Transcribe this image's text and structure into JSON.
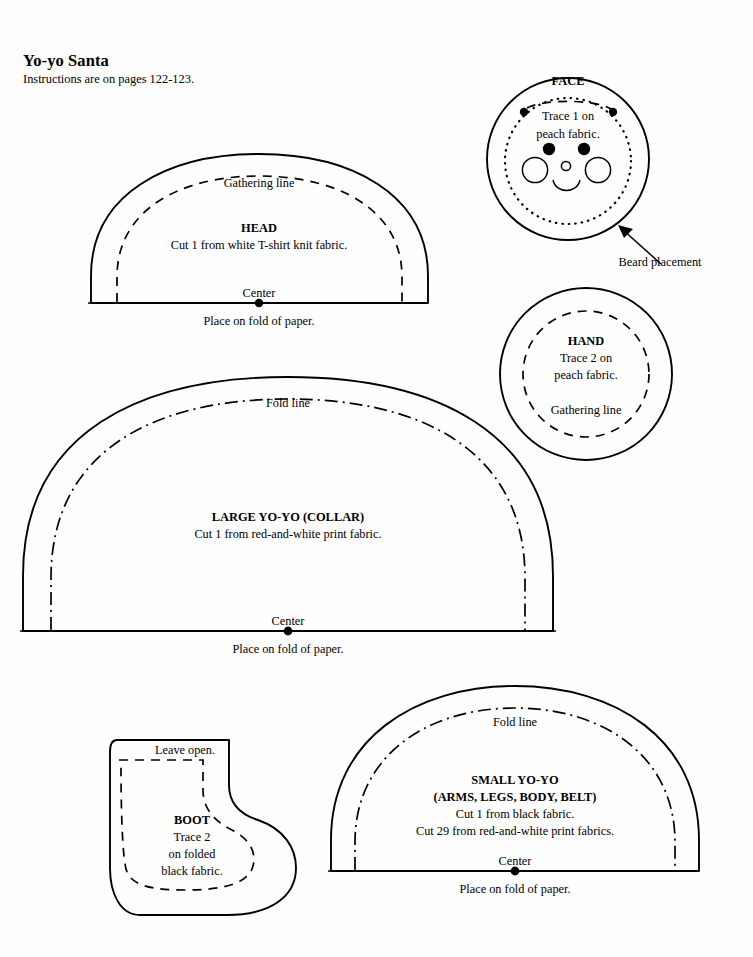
{
  "page": {
    "title": "Yo-yo Santa",
    "subtitle": "Instructions are on pages 122-123.",
    "background_color": "#fefefe",
    "ink_color": "#000000"
  },
  "patterns": {
    "head": {
      "name": "HEAD",
      "instruction": "Cut 1 from white T-shirt knit fabric.",
      "gathering_label": "Gathering line",
      "center_label": "Center",
      "fold_note": "Place on fold of paper."
    },
    "face": {
      "name": "FACE",
      "instruction_line1": "Trace 1 on",
      "instruction_line2": "peach fabric.",
      "beard_label": "Beard placement"
    },
    "hand": {
      "name": "HAND",
      "instruction_line1": "Trace 2 on",
      "instruction_line2": "peach fabric.",
      "gathering_label": "Gathering line"
    },
    "large_yoyo": {
      "name": "LARGE YO-YO (COLLAR)",
      "instruction": "Cut 1 from red-and-white print fabric.",
      "fold_line_label": "Fold line",
      "center_label": "Center",
      "fold_note": "Place on fold of paper."
    },
    "small_yoyo": {
      "name": "SMALL YO-YO",
      "name_line2": "(ARMS, LEGS, BODY, BELT)",
      "instruction_line1": "Cut 1 from black fabric.",
      "instruction_line2": "Cut 29 from red-and-white print fabrics.",
      "fold_line_label": "Fold line",
      "center_label": "Center",
      "fold_note": "Place on fold of paper."
    },
    "boot": {
      "name": "BOOT",
      "leave_open_label": "Leave open.",
      "instruction_line1": "Trace 2",
      "instruction_line2": "on folded",
      "instruction_line3": "black fabric."
    }
  }
}
